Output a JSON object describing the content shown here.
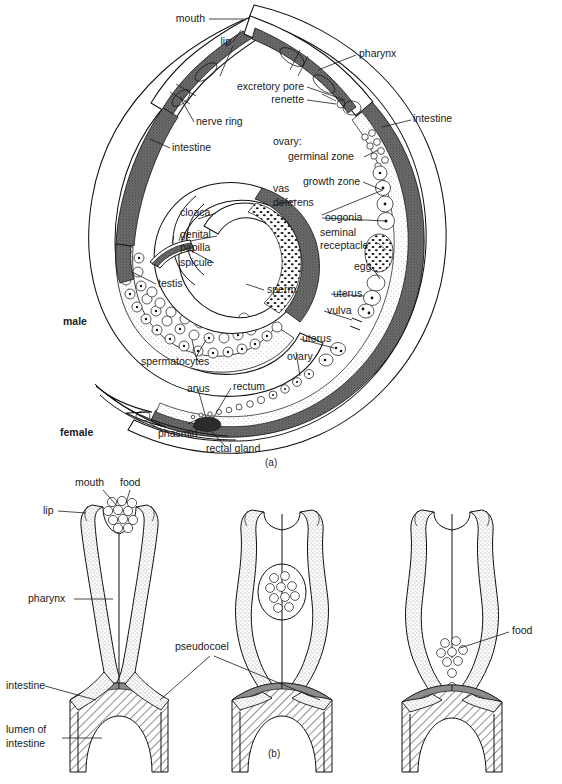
{
  "figure": {
    "kind": "anatomical-diagram",
    "panels": [
      {
        "id": "a",
        "caption": "(a)",
        "caption_x": 265,
        "caption_y": 466
      },
      {
        "id": "b",
        "caption": "(b)",
        "caption_y": 757,
        "caption_x": 268
      }
    ]
  },
  "colors": {
    "ink": "#111111",
    "text": "#1a1a1a",
    "paper": "#ffffff",
    "intestine_shade": "#6f6f6f",
    "pharynx_stipple": "#b8b8b8",
    "cuticle_fill": "#ffffff",
    "hatch": "#333333"
  },
  "panel_a": {
    "sex_labels": [
      {
        "name": "male-label",
        "text": "male",
        "x": 63,
        "y": 325
      },
      {
        "name": "female-label",
        "text": "female",
        "x": 60,
        "y": 436
      }
    ],
    "labels": [
      {
        "name": "mouth",
        "text": "mouth",
        "x": 205,
        "y": 22,
        "anchor": "end"
      },
      {
        "name": "lip",
        "text": "lip",
        "x": 231,
        "y": 45,
        "anchor": "end"
      },
      {
        "name": "pharynx",
        "text": "pharynx",
        "x": 359,
        "y": 57,
        "anchor": "start"
      },
      {
        "name": "excretory-pore",
        "text": "excretory pore",
        "x": 304,
        "y": 90,
        "anchor": "end"
      },
      {
        "name": "renette",
        "text": "renette",
        "x": 304,
        "y": 103,
        "anchor": "end"
      },
      {
        "name": "intestine-right",
        "text": "intestine",
        "x": 413,
        "y": 122,
        "anchor": "start"
      },
      {
        "name": "nerve-ring",
        "text": "nerve ring",
        "x": 196,
        "y": 125,
        "anchor": "start"
      },
      {
        "name": "intestine-left",
        "text": "intestine",
        "x": 172,
        "y": 151,
        "anchor": "start"
      },
      {
        "name": "ovary-heading",
        "text": "ovary:",
        "x": 273,
        "y": 145,
        "anchor": "start"
      },
      {
        "name": "germinal-zone",
        "text": "germinal zone",
        "x": 288,
        "y": 160,
        "anchor": "start"
      },
      {
        "name": "growth-zone",
        "text": "growth zone",
        "x": 303,
        "y": 185,
        "anchor": "start"
      },
      {
        "name": "vas",
        "text": "vas",
        "x": 273,
        "y": 192,
        "anchor": "start"
      },
      {
        "name": "deferens",
        "text": "deferens",
        "x": 273,
        "y": 206,
        "anchor": "start"
      },
      {
        "name": "cloaca",
        "text": "cloaca",
        "x": 180,
        "y": 216,
        "anchor": "start"
      },
      {
        "name": "oogonia",
        "text": "oogonia",
        "x": 325,
        "y": 221,
        "anchor": "start"
      },
      {
        "name": "genital",
        "text": "genital",
        "x": 180,
        "y": 238,
        "anchor": "start"
      },
      {
        "name": "seminal",
        "text": "seminal",
        "x": 320,
        "y": 236,
        "anchor": "start"
      },
      {
        "name": "papilla",
        "text": "papilla",
        "x": 180,
        "y": 251,
        "anchor": "start"
      },
      {
        "name": "receptacle",
        "text": "receptacle",
        "x": 320,
        "y": 249,
        "anchor": "start"
      },
      {
        "name": "spicule",
        "text": "spicule",
        "x": 180,
        "y": 266,
        "anchor": "start"
      },
      {
        "name": "egg",
        "text": "egg",
        "x": 354,
        "y": 270,
        "anchor": "start"
      },
      {
        "name": "testis",
        "text": "testis",
        "x": 158,
        "y": 287,
        "anchor": "start"
      },
      {
        "name": "uterus-upper",
        "text": "uterus",
        "x": 333,
        "y": 297,
        "anchor": "start"
      },
      {
        "name": "sperm",
        "text": "sperm",
        "x": 267,
        "y": 293,
        "anchor": "start"
      },
      {
        "name": "vulva",
        "text": "vulva",
        "x": 327,
        "y": 314,
        "anchor": "start"
      },
      {
        "name": "uterus-lower",
        "text": "uterus",
        "x": 302,
        "y": 342,
        "anchor": "start"
      },
      {
        "name": "spermatocytes",
        "text": "spermatocytes",
        "x": 141,
        "y": 365,
        "anchor": "start"
      },
      {
        "name": "ovary",
        "text": "ovary",
        "x": 287,
        "y": 360,
        "anchor": "start"
      },
      {
        "name": "anus",
        "text": "anus",
        "x": 187,
        "y": 392,
        "anchor": "start"
      },
      {
        "name": "rectum",
        "text": "rectum",
        "x": 233,
        "y": 390,
        "anchor": "start"
      },
      {
        "name": "phasmid",
        "text": "phasmid",
        "x": 158,
        "y": 437,
        "anchor": "start"
      },
      {
        "name": "rectal-gland",
        "text": "rectal gland",
        "x": 206,
        "y": 452,
        "anchor": "start"
      }
    ]
  },
  "panel_b": {
    "labels": [
      {
        "name": "mouth",
        "text": "mouth",
        "x": 75,
        "y": 486,
        "anchor": "start"
      },
      {
        "name": "food-left",
        "text": "food",
        "x": 120,
        "y": 486,
        "anchor": "start"
      },
      {
        "name": "lip",
        "text": "lip",
        "x": 43,
        "y": 514,
        "anchor": "start"
      },
      {
        "name": "pharynx",
        "text": "pharynx",
        "x": 28,
        "y": 602,
        "anchor": "start"
      },
      {
        "name": "pseudocoel",
        "text": "pseudocoel",
        "x": 175,
        "y": 650,
        "anchor": "start"
      },
      {
        "name": "intestine",
        "text": "intestine",
        "x": 6,
        "y": 689,
        "anchor": "start"
      },
      {
        "name": "lumen-of",
        "text": "lumen of",
        "x": 6,
        "y": 733,
        "anchor": "start"
      },
      {
        "name": "intestine-2",
        "text": "intestine",
        "x": 6,
        "y": 747,
        "anchor": "start"
      },
      {
        "name": "food-right",
        "text": "food",
        "x": 512,
        "y": 634,
        "anchor": "start"
      }
    ],
    "diagram_count": 3
  }
}
